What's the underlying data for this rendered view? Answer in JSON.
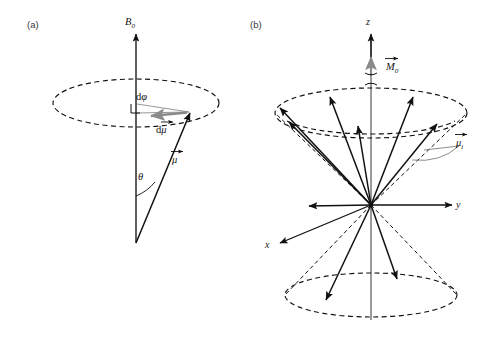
{
  "figure": {
    "background_color": "#ffffff",
    "ink_color": "#111111",
    "accent_gray": "#8a8a8a",
    "width": 483,
    "height": 340
  },
  "panel_a": {
    "label": "(a)",
    "field_axis_label": "B",
    "field_axis_subscript": "0",
    "moment_label": "μ",
    "moment_delta_label": "dμ",
    "delta_phi_label_prefix": "d",
    "delta_phi_label_symbol": "φ",
    "angle_label": "θ",
    "description": "Single magnetic moment vector precessing about B0 on a dashed cone rim ellipse; d-mu increment arrow shown in gray along the rim, with right angle marker and d-phi at the cone apex circle."
  },
  "panel_b": {
    "label": "(b)",
    "z_axis_label": "z",
    "y_axis_label": "y",
    "x_axis_label": "x",
    "magnetization_label": "M",
    "magnetization_subscript": "0",
    "moment_i_label": "μ",
    "moment_i_subscript": "i",
    "upper_cone_vector_count": 7,
    "lower_cone_vector_count": 2,
    "description": "Ensemble of individual magnetic moments distributed on upper and lower precession cones about the z axis, summing to net magnetization M0 along z."
  }
}
